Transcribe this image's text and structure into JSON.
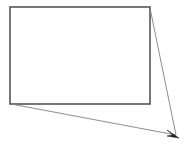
{
  "canvas": {
    "width": 187,
    "height": 149,
    "background_color": "#ffffff",
    "title": "Rectangle with converging pointer lines"
  },
  "colors": {
    "rectangle_stroke": "#555555",
    "leader_line_stroke": "#808080",
    "arrowhead_fill": "#1a1a1a",
    "background": "#ffffff"
  },
  "shapes": {
    "rectangle": {
      "name": "rectangle-outline",
      "x": 10,
      "y": 7,
      "width": 140,
      "height": 97,
      "stroke_width": 1.6,
      "fill": "none"
    },
    "leader_line_top": {
      "name": "leader-line-from-top-right",
      "x1": 150,
      "y1": 8,
      "x2": 176,
      "y2": 135,
      "stroke_width": 0.9
    },
    "leader_line_bottom": {
      "name": "leader-line-from-bottom-left",
      "x1": 11,
      "y1": 104,
      "x2": 176,
      "y2": 135,
      "stroke_width": 0.9
    },
    "arrowhead": {
      "name": "arrowhead-marker",
      "tip_x": 179,
      "tip_y": 138,
      "points": "179,138 167,131 172,135 168,137"
    }
  }
}
